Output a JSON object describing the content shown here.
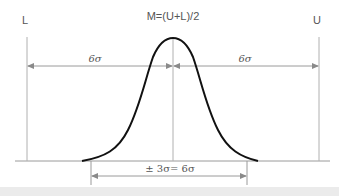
{
  "diagram": {
    "title": "M=(U+L)/2",
    "lower_limit_label": "L",
    "upper_limit_label": "U",
    "left_span_label": "6σ",
    "right_span_label": "6σ",
    "bottom_span_label": "± 3σ= 6σ",
    "colors": {
      "curve": "#111111",
      "guide_lines": "#aaaaaa",
      "arrows": "#999999",
      "text": "#555555",
      "footer_strip": "#ebebeb"
    }
  }
}
